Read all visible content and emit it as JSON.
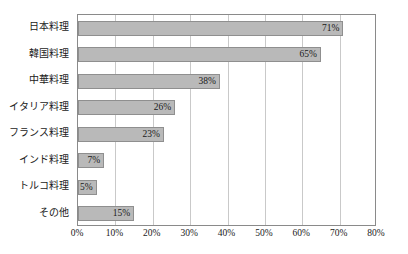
{
  "chart_data": {
    "type": "bar",
    "orientation": "horizontal",
    "title": "",
    "xlabel": "",
    "ylabel": "",
    "xlim": [
      0,
      80
    ],
    "grid": true,
    "legend": false,
    "categories": [
      "日本料理",
      "韓国料理",
      "中華料理",
      "イタリア料理",
      "フランス料理",
      "インド料理",
      "トルコ料理",
      "その他"
    ],
    "values": [
      71,
      65,
      38,
      26,
      23,
      7,
      5,
      15
    ],
    "value_labels": [
      "71%",
      "65%",
      "38%",
      "26%",
      "23%",
      "7%",
      "5%",
      "15%"
    ],
    "xticks": [
      0,
      10,
      20,
      30,
      40,
      50,
      60,
      70,
      80
    ],
    "xtick_labels": [
      "0%",
      "10%",
      "20%",
      "30%",
      "40%",
      "50%",
      "60%",
      "70%",
      "80%"
    ]
  },
  "style": {
    "bar_fill": "#b9b9b9",
    "bar_border": "#8f8f8f",
    "grid_color": "#c9c9c9",
    "frame_color": "#8a8a8a",
    "text_color": "#1a1a1a",
    "background": "#ffffff"
  }
}
